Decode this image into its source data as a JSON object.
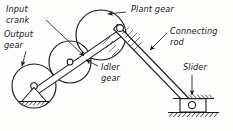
{
  "figure": {
    "background_color": "#fdfdfb",
    "ink_color": "#1b1b1d",
    "width": 233,
    "height": 131
  },
  "labels": {
    "input_crank": "Input\ncrank",
    "input_crank_line1": "Input",
    "input_crank_line2": "crank",
    "output_gear_line1": "Output",
    "output_gear_line2": "gear",
    "plant_gear": "Plant gear",
    "connecting_rod_line1": "Connecting",
    "connecting_rod_line2": "rod",
    "idler_gear_line1": "Idler",
    "idler_gear_line2": "gear",
    "slider": "Slider"
  },
  "components": {
    "output_gear": {
      "name": "Output gear",
      "center_x": 34,
      "center_y": 86,
      "radius": 22
    },
    "idler_gear": {
      "name": "Idler gear",
      "center_x": 70,
      "center_y": 62,
      "radius": 21
    },
    "plant_gear": {
      "name": "Plant gear",
      "center_x": 101,
      "center_y": 35,
      "radius": 25
    },
    "crank_pin": {
      "name": "Crank pin",
      "x": 120,
      "y": 28
    },
    "idler_pivot": {
      "name": "Idler pivot",
      "x": 70,
      "y": 62
    },
    "output_pivot": {
      "name": "Output gear ground pivot",
      "x": 34,
      "y": 86
    },
    "slider": {
      "name": "Slider",
      "x": 192,
      "y": 104
    }
  }
}
